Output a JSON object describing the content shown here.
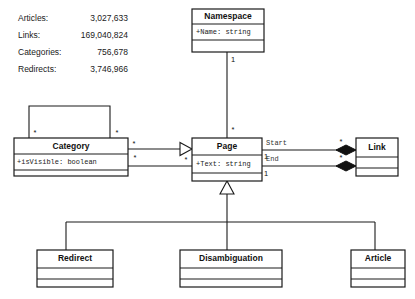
{
  "diagram": {
    "type": "uml-class-diagram",
    "background": "#ffffff",
    "line_color": "#1a1a1a"
  },
  "stats": {
    "rows": [
      {
        "label": "Articles:",
        "value": "3,027,633"
      },
      {
        "label": "Links:",
        "value": "169,040,824"
      },
      {
        "label": "Categories:",
        "value": "756,678"
      },
      {
        "label": "Redirects:",
        "value": "3,746,966"
      }
    ]
  },
  "classes": {
    "namespace": {
      "name": "Namespace",
      "attribute": "+Name: string"
    },
    "category": {
      "name": "Category",
      "attribute": "+isVisible: boolean"
    },
    "page": {
      "name": "Page",
      "attribute": "+Text: string"
    },
    "link": {
      "name": "Link",
      "attribute": ""
    },
    "redirect": {
      "name": "Redirect",
      "attribute": ""
    },
    "disambiguation": {
      "name": "Disambiguation",
      "attribute": ""
    },
    "article": {
      "name": "Article",
      "attribute": ""
    }
  },
  "multiplicities": {
    "namespace_end": "1",
    "page_from_namespace": "*",
    "category_self_left": "*",
    "category_self_right": "*",
    "category_gen_source": "*",
    "page_gen_target": "*",
    "category_assoc_right": "*",
    "page_start_end": "1",
    "page_end_end": "1",
    "link_start_end": "*",
    "link_end_end": "*"
  },
  "roles": {
    "start": "Start",
    "end": "End"
  }
}
